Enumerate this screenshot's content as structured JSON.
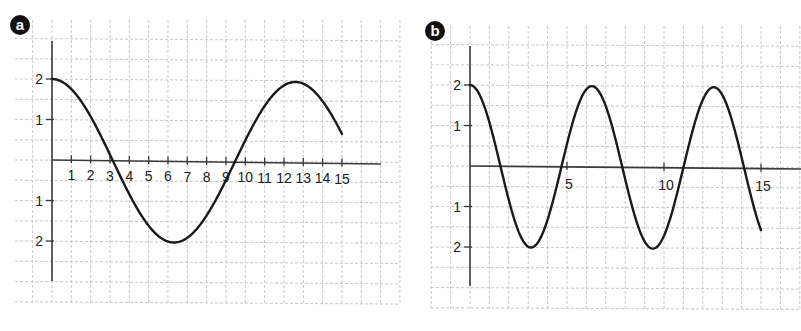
{
  "figure": {
    "panels": [
      {
        "id": "a",
        "label": "a"
      },
      {
        "id": "b",
        "label": "b"
      }
    ]
  },
  "colors": {
    "curve": "#1a1a1a",
    "axis": "#3a3a3a",
    "grid": "#c8c8c8",
    "badge": "#111111",
    "background": "#ffffff"
  },
  "chart_data": [
    {
      "panel": "a",
      "type": "line",
      "title": "",
      "xlabel": "",
      "ylabel": "",
      "function_estimate": "y = 2*cos(2*pi*x/12.6)",
      "amplitude": 2,
      "period": 12.6,
      "x_range": [
        0,
        15
      ],
      "ylim": [
        -3,
        3
      ],
      "xlim": [
        0,
        17
      ],
      "grid": true,
      "legend": null,
      "x_ticks": [
        1,
        2,
        3,
        4,
        5,
        6,
        7,
        8,
        9,
        10,
        11,
        12,
        13,
        14,
        15
      ],
      "x_tick_labels": [
        "1",
        "2",
        "3",
        "4",
        "5",
        "6",
        "7",
        "8",
        "9",
        "10",
        "11",
        "12",
        "13",
        "14",
        "15"
      ],
      "y_ticks": [
        2,
        1,
        -1,
        -2
      ],
      "y_tick_labels": [
        "2",
        "1",
        "1",
        "2"
      ],
      "series": [
        {
          "name": "curve-a",
          "x": [
            0,
            1,
            2,
            3,
            3.15,
            4,
            5,
            6,
            6.3,
            7,
            8,
            9,
            9.45,
            10,
            11,
            12,
            12.6,
            13,
            14,
            15
          ],
          "y": [
            2.0,
            1.76,
            1.08,
            0.15,
            0.0,
            -0.82,
            -1.61,
            -1.99,
            -2.0,
            -1.89,
            -1.33,
            -0.44,
            0.0,
            0.54,
            1.42,
            1.95,
            2.0,
            1.95,
            1.53,
            0.73
          ]
        }
      ]
    },
    {
      "panel": "b",
      "type": "line",
      "title": "",
      "xlabel": "",
      "ylabel": "",
      "function_estimate": "y = 2*cos(x)",
      "amplitude": 2,
      "period": 6.283,
      "x_range": [
        0,
        15
      ],
      "ylim": [
        -3,
        3
      ],
      "xlim": [
        0,
        17
      ],
      "grid": true,
      "legend": null,
      "x_ticks": [
        5,
        10,
        15
      ],
      "x_tick_labels": [
        "5",
        "10",
        "15"
      ],
      "y_ticks": [
        2,
        1,
        -1,
        -2
      ],
      "y_tick_labels": [
        "2",
        "1",
        "1",
        "2"
      ],
      "series": [
        {
          "name": "curve-b",
          "x": [
            0,
            1.57,
            3.14,
            4.71,
            6.28,
            7.85,
            9.42,
            11.0,
            12.57,
            14.14,
            15
          ],
          "y": [
            2.0,
            0.0,
            -2.0,
            0.0,
            2.0,
            0.0,
            -2.0,
            0.0,
            2.0,
            0.0,
            -1.52
          ]
        }
      ]
    }
  ]
}
